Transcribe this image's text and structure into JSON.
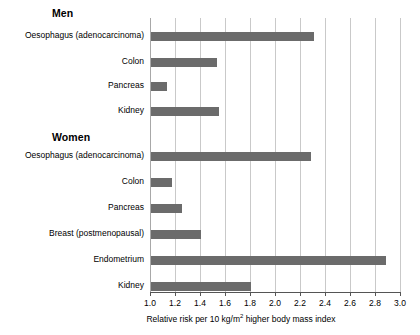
{
  "chart_data": {
    "type": "bar",
    "orientation": "horizontal",
    "title": "",
    "subtitle": "",
    "xlabel": "Relative risk per 10 kg/m² higher body mass index",
    "ylabel": "",
    "xlim": [
      1.0,
      3.0
    ],
    "grid": true,
    "legend": null,
    "bar_color": "#6b6b6b",
    "gridline_color": "#c9c9c9",
    "axis_color": "#555555",
    "xticks": [
      1.0,
      1.2,
      1.4,
      1.6,
      1.8,
      2.0,
      2.2,
      2.4,
      2.6,
      2.8,
      3.0
    ],
    "xtick_labels": [
      "1.0",
      "1.2",
      "1.4",
      "1.6",
      "1.8",
      "2.0",
      "2.2",
      "2.4",
      "2.6",
      "2.8",
      "3.0"
    ],
    "groups": [
      {
        "name": "Men",
        "categories": [
          "Oesophagus (adenocarcinoma)",
          "Colon",
          "Pancreas",
          "Kidney"
        ],
        "values": [
          2.3,
          1.53,
          1.13,
          1.54
        ]
      },
      {
        "name": "Women",
        "categories": [
          "Oesophagus (adenocarcinoma)",
          "Colon",
          "Pancreas",
          "Breast (postmenopausal)",
          "Endometrium",
          "Kidney"
        ],
        "values": [
          2.28,
          1.17,
          1.25,
          1.4,
          2.88,
          1.8
        ]
      }
    ]
  },
  "headings": {
    "men": "Men",
    "women": "Women"
  },
  "axis": {
    "title_prefix": "Relative risk per 10 kg/m",
    "title_sup": "2",
    "title_suffix": " higher body mass index"
  }
}
